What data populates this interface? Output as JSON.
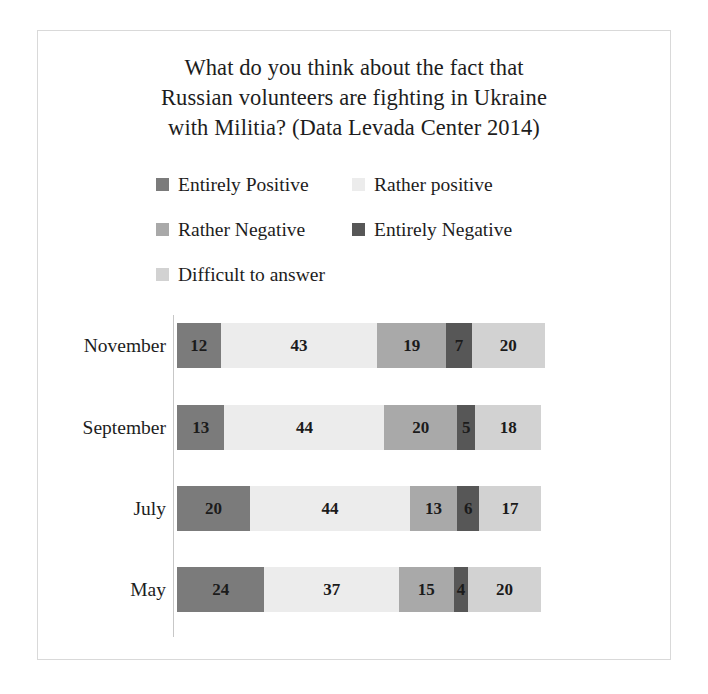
{
  "chart_data": {
    "type": "bar",
    "orientation": "horizontal",
    "stacked": true,
    "title": "What do you think about the fact that Russian volunteers are fighting in Ukraine with Militia? (Data Levada Center 2014)",
    "title_lines": [
      "What do you think about the fact that",
      "Russian volunteers are fighting in Ukraine",
      "with Militia? (Data Levada Center 2014)"
    ],
    "xlabel": "",
    "ylabel": "",
    "xlim": [
      0,
      101
    ],
    "grid": false,
    "legend_position": "top",
    "categories": [
      "November",
      "September",
      "July",
      "May"
    ],
    "series": [
      {
        "name": "Entirely Positive",
        "color": "#7b7b7b",
        "values": [
          12,
          13,
          20,
          24
        ]
      },
      {
        "name": "Rather positive",
        "color": "#ececec",
        "values": [
          43,
          44,
          44,
          37
        ]
      },
      {
        "name": "Rather Negative",
        "color": "#a9a9a9",
        "values": [
          19,
          20,
          13,
          15
        ]
      },
      {
        "name": "Entirely Negative",
        "color": "#575757",
        "values": [
          7,
          5,
          6,
          4
        ]
      },
      {
        "name": "Difficult to answer",
        "color": "#d2d2d2",
        "values": [
          20,
          18,
          17,
          20
        ]
      }
    ],
    "rows": [
      {
        "category": "November",
        "values": [
          12,
          43,
          19,
          7,
          20
        ]
      },
      {
        "category": "September",
        "values": [
          13,
          44,
          20,
          5,
          18
        ]
      },
      {
        "category": "July",
        "values": [
          20,
          44,
          13,
          6,
          17
        ]
      },
      {
        "category": "May",
        "values": [
          24,
          37,
          15,
          4,
          20
        ]
      }
    ]
  },
  "legend": {
    "rows": [
      [
        {
          "label": "Entirely Positive",
          "color": "#7b7b7b"
        },
        {
          "label": "Rather positive",
          "color": "#ececec"
        }
      ],
      [
        {
          "label": "Rather Negative",
          "color": "#a9a9a9"
        },
        {
          "label": "Entirely Negative",
          "color": "#575757"
        }
      ],
      [
        {
          "label": "Difficult to answer",
          "color": "#d2d2d2"
        }
      ]
    ]
  },
  "style": {
    "background": "#ffffff",
    "border_color": "#d9d9d9",
    "text_color": "#1d1d1d",
    "axis_color": "#c7c7c7",
    "px_per_unit": 3.64
  }
}
